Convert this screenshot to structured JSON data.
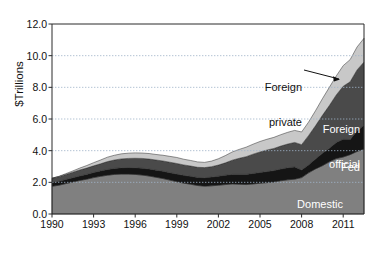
{
  "chart_data": {
    "type": "area",
    "stacked": true,
    "title": "",
    "xlabel": "",
    "ylabel": "$Trillions",
    "xlim": [
      1990,
      2012.5
    ],
    "ylim": [
      0.0,
      12.0
    ],
    "yticks": [
      "0.0",
      "2.0",
      "4.0",
      "6.0",
      "8.0",
      "10.0",
      "12.0"
    ],
    "ytick_values": [
      0.0,
      2.0,
      4.0,
      6.0,
      8.0,
      10.0,
      12.0
    ],
    "xticks": [
      "1990",
      "1993",
      "1996",
      "1999",
      "2002",
      "2005",
      "2008",
      "2011"
    ],
    "xtick_values": [
      1990,
      1993,
      1996,
      1999,
      2002,
      2005,
      2008,
      2011
    ],
    "grid": "horizontal-dotted",
    "legend_position": "inline-annotations",
    "x": [
      1990,
      1990.5,
      1991,
      1991.5,
      1992,
      1992.5,
      1993,
      1993.5,
      1994,
      1994.5,
      1995,
      1995.5,
      1996,
      1996.5,
      1997,
      1997.5,
      1998,
      1998.5,
      1999,
      1999.5,
      2000,
      2000.5,
      2001,
      2001.5,
      2002,
      2002.5,
      2003,
      2003.5,
      2004,
      2004.5,
      2005,
      2005.5,
      2006,
      2006.5,
      2007,
      2007.5,
      2008,
      2008.5,
      2009,
      2009.5,
      2010,
      2010.5,
      2011,
      2011.5,
      2012,
      2012.5
    ],
    "series": [
      {
        "name": "Domestic private",
        "color": "#808080",
        "values": [
          1.75,
          1.82,
          1.92,
          2.02,
          2.12,
          2.2,
          2.3,
          2.38,
          2.45,
          2.5,
          2.52,
          2.52,
          2.5,
          2.46,
          2.4,
          2.32,
          2.24,
          2.14,
          2.04,
          1.95,
          1.88,
          1.8,
          1.76,
          1.78,
          1.82,
          1.86,
          1.9,
          1.88,
          1.86,
          1.9,
          1.94,
          1.98,
          2.02,
          2.1,
          2.16,
          2.2,
          2.3,
          2.6,
          2.85,
          3.05,
          3.3,
          3.5,
          3.6,
          3.75,
          3.95,
          4.1
        ]
      },
      {
        "name": "Fed",
        "color": "#151515",
        "values": [
          0.24,
          0.25,
          0.26,
          0.27,
          0.28,
          0.3,
          0.32,
          0.34,
          0.36,
          0.38,
          0.4,
          0.41,
          0.42,
          0.43,
          0.44,
          0.45,
          0.46,
          0.47,
          0.48,
          0.49,
          0.5,
          0.51,
          0.53,
          0.55,
          0.57,
          0.59,
          0.6,
          0.62,
          0.64,
          0.66,
          0.68,
          0.7,
          0.72,
          0.74,
          0.76,
          0.77,
          0.48,
          0.5,
          0.62,
          0.78,
          0.85,
          1.02,
          1.12,
          0.95,
          1.3,
          1.5
        ]
      },
      {
        "name": "Foreign official",
        "color": "#4a4a4a",
        "values": [
          0.27,
          0.29,
          0.32,
          0.35,
          0.38,
          0.4,
          0.42,
          0.45,
          0.5,
          0.53,
          0.56,
          0.58,
          0.6,
          0.62,
          0.63,
          0.64,
          0.65,
          0.66,
          0.67,
          0.66,
          0.65,
          0.64,
          0.64,
          0.66,
          0.7,
          0.78,
          0.9,
          1.02,
          1.12,
          1.22,
          1.3,
          1.36,
          1.4,
          1.45,
          1.5,
          1.55,
          1.6,
          1.85,
          2.1,
          2.4,
          2.7,
          3.0,
          3.35,
          3.65,
          3.85,
          4.0
        ]
      },
      {
        "name": "Foreign private",
        "color": "#c8c8c8",
        "values": [
          0.0,
          0.02,
          0.05,
          0.08,
          0.12,
          0.16,
          0.2,
          0.24,
          0.28,
          0.3,
          0.32,
          0.33,
          0.34,
          0.34,
          0.35,
          0.35,
          0.36,
          0.37,
          0.38,
          0.36,
          0.35,
          0.34,
          0.33,
          0.35,
          0.4,
          0.46,
          0.52,
          0.56,
          0.6,
          0.63,
          0.66,
          0.68,
          0.7,
          0.72,
          0.74,
          0.76,
          0.8,
          0.85,
          0.95,
          1.05,
          1.15,
          1.2,
          1.3,
          1.4,
          1.45,
          1.5
        ]
      }
    ],
    "annotations": [
      {
        "id": "foreign-private",
        "label_line1": "Foreign",
        "label_line2": "private",
        "style": "dark-with-leader"
      },
      {
        "id": "foreign-official",
        "label_line1": "Foreign",
        "label_line2": "official",
        "style": "light-inline"
      },
      {
        "id": "fed",
        "label_line1": "Fed",
        "label_line2": "",
        "style": "light-inline"
      },
      {
        "id": "domestic-private",
        "label_line1": "Domestic",
        "label_line2": "private",
        "style": "light-inline"
      }
    ]
  }
}
